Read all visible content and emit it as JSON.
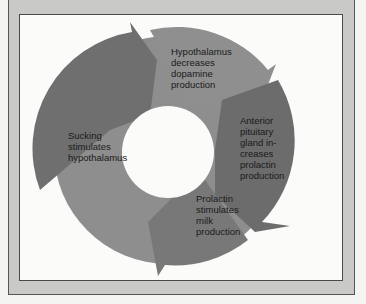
{
  "diagram": {
    "type": "cycle",
    "colors": {
      "frame": "#c9c9c7",
      "panel": "#fbfbfa",
      "ring_dark": "#6e6e6e",
      "ring_mid": "#8a8a8a",
      "ring_light": "#9b9b9b",
      "text": "#1a1a1a"
    },
    "steps": [
      {
        "id": "step-1",
        "label": "Hypothalamus\ndecreases\ndopamine\nproduction"
      },
      {
        "id": "step-2",
        "label": "Anterior\npituitary\ngland in-\ncreases\nprolactin\nproduction"
      },
      {
        "id": "step-3",
        "label": "Prolactin\nstimulates\nmilk\nproduction"
      },
      {
        "id": "step-4",
        "label": "Sucking\nstimulates\nhypothalamus"
      }
    ],
    "flow": "clockwise"
  }
}
